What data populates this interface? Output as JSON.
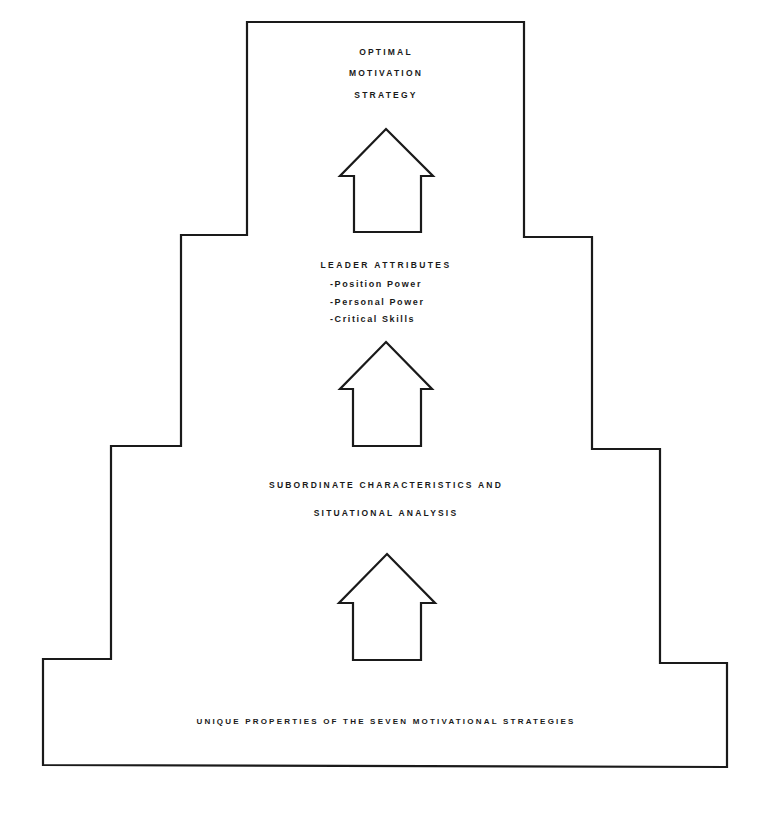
{
  "diagram": {
    "type": "stepped-pyramid-flow",
    "colors": {
      "line": "#1a1a1a",
      "background": "#ffffff"
    },
    "tiers": [
      {
        "id": "top",
        "lines": [
          "OPTIMAL",
          "MOTIVATION",
          "STRATEGY"
        ]
      },
      {
        "id": "leader",
        "title": "LEADER ATTRIBUTES",
        "bullets": [
          "-Position Power",
          "-Personal Power",
          "-Critical Skills"
        ]
      },
      {
        "id": "subordinate",
        "lines": [
          "SUBORDINATE CHARACTERISTICS AND",
          "SITUATIONAL ANALYSIS"
        ]
      },
      {
        "id": "base",
        "lines": [
          "UNIQUE PROPERTIES OF THE SEVEN MOTIVATIONAL STRATEGIES"
        ]
      }
    ],
    "arrows": [
      {
        "name": "arrow-up-1",
        "direction": "up"
      },
      {
        "name": "arrow-up-2",
        "direction": "up"
      },
      {
        "name": "arrow-up-3",
        "direction": "up"
      }
    ]
  }
}
